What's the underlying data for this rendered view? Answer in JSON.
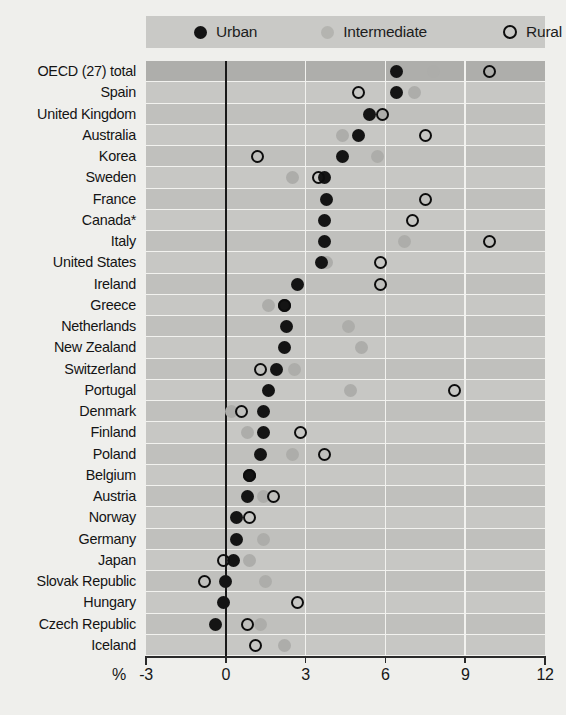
{
  "legend": {
    "entries": [
      {
        "key": "urban",
        "label": "Urban",
        "color": "#141414",
        "style": "filled"
      },
      {
        "key": "intermediate",
        "label": "Intermediate",
        "color": "#adadaa",
        "style": "filled"
      },
      {
        "key": "rural",
        "label": "Rural",
        "color": "#0d0d0d",
        "style": "open"
      }
    ]
  },
  "axis": {
    "unit_label": "%",
    "ticks": [
      -3,
      0,
      3,
      6,
      9,
      12
    ],
    "tick_labels": [
      "-3",
      "0",
      "3",
      "6",
      "9",
      "12"
    ],
    "min": -3,
    "max": 12
  },
  "chart_data": {
    "type": "scatter",
    "title": "",
    "subtitle": "",
    "xlabel": "%",
    "ylabel": "",
    "xlim": [
      -3,
      12
    ],
    "grid": true,
    "legend_position": "top",
    "orientation": "horizontal",
    "categories": [
      "OECD (27) total",
      "Spain",
      "United Kingdom",
      "Australia",
      "Korea",
      "Sweden",
      "France",
      "Canada*",
      "Italy",
      "United States",
      "Ireland",
      "Greece",
      "Netherlands",
      "New Zealand",
      "Switzerland",
      "Portugal",
      "Denmark",
      "Finland",
      "Poland",
      "Belgium",
      "Austria",
      "Norway",
      "Germany",
      "Japan",
      "Slovak Republic",
      "Hungary",
      "Czech Republic",
      "Iceland"
    ],
    "series": [
      {
        "name": "Urban",
        "key": "urban",
        "color": "#141414",
        "values": [
          6.4,
          6.4,
          5.4,
          5.0,
          4.4,
          3.7,
          3.8,
          3.7,
          3.7,
          3.6,
          2.7,
          2.2,
          2.3,
          2.2,
          1.9,
          1.6,
          1.4,
          1.4,
          1.3,
          0.9,
          0.8,
          0.4,
          0.4,
          0.3,
          0.0,
          -0.1,
          -0.4,
          null
        ]
      },
      {
        "name": "Intermediate",
        "key": "intermediate",
        "color": "#adadaa",
        "values": [
          7.8,
          7.1,
          5.9,
          4.4,
          5.7,
          2.5,
          null,
          null,
          6.7,
          3.8,
          null,
          1.6,
          4.6,
          5.1,
          2.6,
          4.7,
          0.2,
          0.8,
          2.5,
          0.9,
          1.4,
          null,
          1.4,
          0.9,
          1.5,
          null,
          1.3,
          2.2
        ]
      },
      {
        "name": "Rural",
        "key": "rural",
        "color": "#0d0d0d",
        "values": [
          9.9,
          5.0,
          5.9,
          7.5,
          1.2,
          3.5,
          7.5,
          7.0,
          9.9,
          5.8,
          5.8,
          2.2,
          null,
          null,
          1.3,
          8.6,
          0.6,
          2.8,
          3.7,
          0.9,
          1.8,
          0.9,
          null,
          -0.1,
          -0.8,
          2.7,
          0.8,
          1.1
        ]
      }
    ]
  }
}
